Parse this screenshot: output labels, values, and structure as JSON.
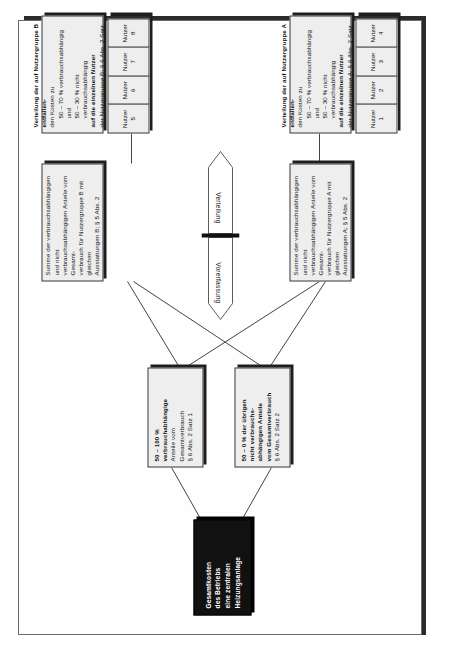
{
  "document": {
    "title": "Gesamtkosten des Betriebs einer zentralen Heizungsanlage – Verteilungsschema"
  },
  "diagram": {
    "root": {
      "line1": "Gesamtkosten",
      "line2": "des Betriebs",
      "line3": "eine zentralen",
      "line4": "Heizungsanlage"
    },
    "split_consumption": {
      "line1": "50 – 100 %",
      "line2": "verbrauchabhängige",
      "line3": "Anteile vom",
      "line4": "Gesamtverbrauch",
      "line5": "§ 6 Abs. 2 Satz 1"
    },
    "split_fixed": {
      "line1": "50 – 0 % der übrigen",
      "line2": "nicht verbrauchs-",
      "line3": "abhängigen Anteile",
      "line4": "vom Gesamtverbrauch",
      "line5": "§ 6 Abs. 2 Satz 2"
    },
    "sum_group_a": {
      "line1": "Summe der verbrauchsabhängigen und nicht",
      "line2": "verbrauchsabhängigen Anteile vom Gesamt-",
      "line3": "verbrauch für Nutzergruppe A mit gleichen",
      "line4": "Ausstattungen A; § 5 Abs. 2"
    },
    "sum_group_b": {
      "line1": "Summe der verbrauchsabhängigen und nicht",
      "line2": "verbrauchsabhängigen Anteile vom Gesamt-",
      "line3": "verbrauch für Nutzergruppe B mit gleichen",
      "line4": "Ausstattungen B; § 5 Abs. 2"
    },
    "dist_group_a": {
      "line1": "Verteilung der auf Nutzergruppe A entfallen-",
      "line2": "den Kosten zu",
      "line3": "50 – 70 % verbrauchsabhängig und",
      "line4": "50 – 30 % nicht verbrauchsabhängig",
      "line5": "auf die einzelnen Nutzer",
      "line6": "der Nutzergruppe A; § 6 Abs. 2 Satz 3, §§ 7 – 9"
    },
    "dist_group_b": {
      "line1": "Verteilung der auf Nutzergruppe B entfallen-",
      "line2": "den Kosten zu",
      "line3": "50 – 70 % verbrauchsabhängig und",
      "line4": "50 – 30 % nicht verbrauchsabhängig",
      "line5": "auf die einzelnen Nutzer",
      "line6": "der Nutzergruppe B; § 6 Abs. 2 Satz 3, §§ 7 – 9"
    },
    "nutzer_group_a": [
      {
        "label": "Nutzer",
        "number": "1"
      },
      {
        "label": "Nutzer",
        "number": "2"
      },
      {
        "label": "Nutzer",
        "number": "3"
      },
      {
        "label": "Nutzer",
        "number": "4"
      }
    ],
    "nutzer_group_b": [
      {
        "label": "Nutzer",
        "number": "5"
      },
      {
        "label": "Nutzer",
        "number": "6"
      },
      {
        "label": "Nutzer",
        "number": "7"
      },
      {
        "label": "Nutzer",
        "number": "8"
      }
    ],
    "phases": {
      "left_label": "Vorerfassung",
      "right_label": "Verteilung"
    },
    "colors": {
      "root_fill": "#111111",
      "root_text": "#ffffff",
      "node_fill": "#eeeeee",
      "node_border": "#3a3a3a",
      "shadow": "#1e1e1e",
      "page_border": "#6b6b6b",
      "page_shadow": "#2b2b2b"
    }
  }
}
